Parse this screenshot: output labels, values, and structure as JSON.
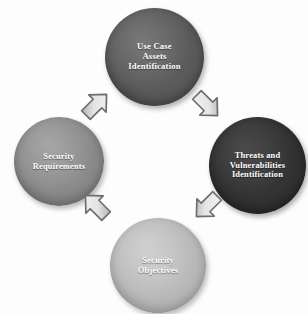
{
  "diagram": {
    "background_color": "#fdfdfd",
    "nodes": [
      {
        "id": "use-case-assets-identification",
        "position": "top",
        "label_lines": [
          "Use Case",
          "Assets",
          "Identification"
        ],
        "fill_color": "#595959",
        "text_color": "#ffffff"
      },
      {
        "id": "threats-and-vulnerabilities-identification",
        "position": "right",
        "label_lines": [
          "Threats and",
          "Vulnerabilities",
          "Identification"
        ],
        "fill_color": "#313131",
        "text_color": "#ffffff"
      },
      {
        "id": "security-objectives",
        "position": "bottom",
        "label_lines": [
          "Security",
          "Objectives"
        ],
        "fill_color": "#b6b6b6",
        "text_color": "#ffffff"
      },
      {
        "id": "security-requirements",
        "position": "left",
        "label_lines": [
          "Security",
          "Requirements"
        ],
        "fill_color": "#888888",
        "text_color": "#ffffff"
      }
    ],
    "arrows": [
      {
        "id": "security-requirements-to-use-case",
        "from": "security-requirements",
        "to": "use-case-assets-identification",
        "direction": "up-right",
        "fill_color": "#d8d8d8",
        "outline_color": "#7d7d7d"
      },
      {
        "id": "use-case-to-threats",
        "from": "use-case-assets-identification",
        "to": "threats-and-vulnerabilities-identification",
        "direction": "down-right",
        "fill_color": "#d8d8d8",
        "outline_color": "#7d7d7d"
      },
      {
        "id": "threats-to-security-objectives",
        "from": "threats-and-vulnerabilities-identification",
        "to": "security-objectives",
        "direction": "down-left",
        "fill_color": "#d8d8d8",
        "outline_color": "#7d7d7d"
      },
      {
        "id": "security-objectives-to-security-requirements",
        "from": "security-objectives",
        "to": "security-requirements",
        "direction": "up-left",
        "fill_color": "#d8d8d8",
        "outline_color": "#7d7d7d"
      }
    ],
    "flow_direction": "clockwise"
  }
}
